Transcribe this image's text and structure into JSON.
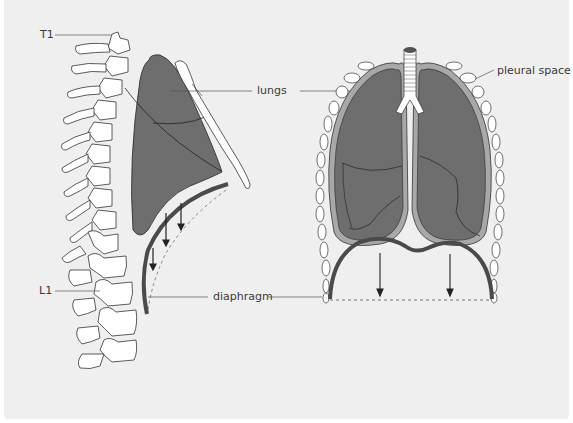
{
  "diagram": {
    "labels": {
      "t1": "T1",
      "l1": "L1",
      "lungs": "lungs",
      "diaphragm": "diaphragm",
      "pleural_space": "pleural space"
    },
    "views": [
      {
        "name": "lateral-view",
        "description": "Side view of spine, lung, rib and diaphragm"
      },
      {
        "name": "frontal-view",
        "description": "Front view of trachea, lungs, rib cage and diaphragm"
      }
    ],
    "colors": {
      "background": "#efefef",
      "lung_fill": "#6e6e6e",
      "pleura": "#a8a8a8",
      "diaphragm": "#4a4a4a",
      "outline": "#333333",
      "bone_fill": "#ffffff",
      "leader_line": "#555555"
    }
  }
}
